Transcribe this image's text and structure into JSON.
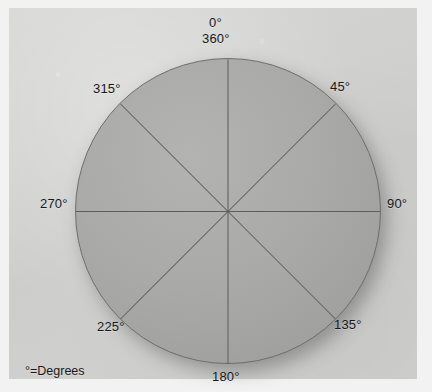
{
  "figure": {
    "type": "polar-compass-diagram",
    "legend": "°=Degrees",
    "labels": {
      "top_primary": "0°",
      "top_secondary": "360°",
      "upper_right": "45°",
      "right": "90°",
      "lower_right": "135°",
      "bottom": "180°",
      "lower_left": "225°",
      "left": "270°",
      "upper_left": "315°"
    }
  },
  "chart_data": {
    "type": "pie",
    "title": "",
    "subtitle": "",
    "xlabel": "",
    "ylabel": "",
    "legend_position": "bottom-left",
    "grid": false,
    "annotations": [
      "°=Degrees"
    ],
    "categories": [
      "0°/360°",
      "45°",
      "90°",
      "135°",
      "180°",
      "225°",
      "270°",
      "315°"
    ],
    "values": [
      45,
      45,
      45,
      45,
      45,
      45,
      45,
      45
    ],
    "tick_labels": [
      "0°",
      "360°",
      "45°",
      "90°",
      "135°",
      "180°",
      "225°",
      "270°",
      "315°"
    ],
    "axis_range_degrees": [
      0,
      360
    ],
    "sector_count": 8,
    "sector_span_degrees": 45,
    "center_x": 219,
    "center_y": 203,
    "radius": 153,
    "colors": {
      "disc_fill": "#a9a9a7",
      "disc_outline": "#6e6e6c",
      "spoke_line": "#5d5d5b",
      "background": "#d2d2d0",
      "text": "#17171a"
    }
  }
}
